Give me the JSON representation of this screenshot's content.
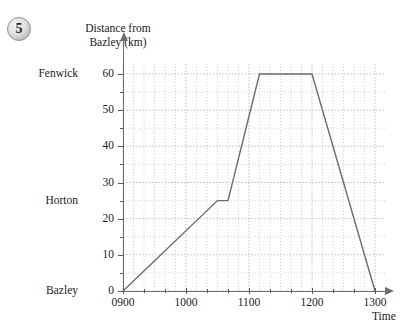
{
  "question": {
    "number": "5"
  },
  "chart_data": {
    "type": "line",
    "title": "Distance from Bazley (km)",
    "xlabel": "Time",
    "ylabel": "Distance from Bazley (km)",
    "xlim": [
      900,
      1300
    ],
    "ylim": [
      0,
      60
    ],
    "grid": true,
    "legend_position": "none",
    "x_tick_labels": [
      "0900",
      "1000",
      "1100",
      "1200",
      "1300"
    ],
    "x_tick_values": [
      900,
      1000,
      1100,
      1200,
      1300
    ],
    "x_minor_step_minutes": 10,
    "y_tick_labels": [
      "0",
      "10",
      "20",
      "30",
      "40",
      "50",
      "60"
    ],
    "y_tick_values": [
      0,
      10,
      20,
      30,
      40,
      50,
      60
    ],
    "y_minor_step_km": 5,
    "place_labels": [
      {
        "name": "Fenwick",
        "distance_km": 60
      },
      {
        "name": "Horton",
        "distance_km": 25
      },
      {
        "name": "Bazley",
        "distance_km": 0
      }
    ],
    "series": [
      {
        "name": "journey",
        "color": "#6b6b6b",
        "points": [
          {
            "time": 900,
            "distance_km": 0
          },
          {
            "time": 1030,
            "distance_km": 25
          },
          {
            "time": 1040,
            "distance_km": 25
          },
          {
            "time": 1110,
            "distance_km": 60
          },
          {
            "time": 1200,
            "distance_km": 60
          },
          {
            "time": 1300,
            "distance_km": 0
          }
        ]
      }
    ]
  },
  "axis": {
    "y_title_lines": "Distance from\nBazley (km)",
    "x_title": "Time"
  },
  "colors": {
    "line": "#6b6b6b",
    "axis": "#6e6e6e",
    "grid": "#b9b9b9",
    "badge_fill": "#d7d7d7",
    "text": "#1a1a1a"
  }
}
